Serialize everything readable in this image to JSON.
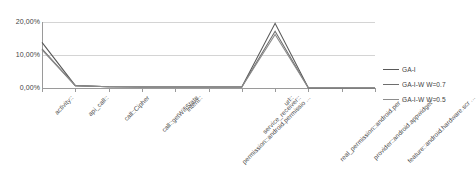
{
  "chart_data": {
    "type": "line",
    "title": "",
    "xlabel": "",
    "ylabel": "",
    "ylim": [
      0,
      25
    ],
    "ytick_values": [
      0,
      10,
      20
    ],
    "ytick_labels": [
      "0,00%",
      "10,00%",
      "20,00%"
    ],
    "grid": true,
    "legend_position": "right",
    "categories": [
      "activity::",
      "api_call::",
      "call::Cipher",
      "call::getWifiState",
      "intent::",
      "permission::android.permissio ...",
      "service_receiver::",
      "url::",
      "real_permission::android.per ...",
      "provider::android.appwidget ...",
      "feature::android.hardware.scr ..."
    ],
    "series": [
      {
        "name": "GA-I",
        "color": "#595959",
        "values": [
          17.3,
          0.9,
          0.5,
          0.4,
          0.4,
          0.4,
          0.4,
          24.5,
          0.0,
          0.0,
          0.0
        ]
      },
      {
        "name": "GA-I-W W=0.7",
        "color": "#6e6e6e",
        "values": [
          14.8,
          0.9,
          0.5,
          0.4,
          0.4,
          0.4,
          0.4,
          21.5,
          0.0,
          0.0,
          0.0
        ]
      },
      {
        "name": "GA-I-W W=0.5",
        "color": "#8c8c8c",
        "values": [
          14.4,
          0.9,
          0.5,
          0.4,
          0.4,
          0.4,
          0.4,
          20.3,
          0.0,
          0.0,
          0.0
        ]
      }
    ]
  },
  "legend": {
    "items": [
      {
        "label": "GA-I",
        "color": "#595959"
      },
      {
        "label": "GA-I-W W=0.7",
        "color": "#6e6e6e"
      },
      {
        "label": "GA-I-W W=0.5",
        "color": "#8c8c8c"
      }
    ]
  },
  "axes": {
    "y_labels": [
      "20,00%",
      "10,00%",
      "0,00%"
    ],
    "x_labels": [
      "activity::",
      "api_call::",
      "call::Cipher",
      "call::getWifiState",
      "intent::",
      "permission::android.permissio ...",
      "service_receiver::",
      "url::",
      "real_permission::android.per ...",
      "provider::android.appwidget ...",
      "feature::android.hardware.scr ..."
    ]
  },
  "colors": {
    "grid": "#d4d4d4",
    "axis": "#9a9a9a",
    "text": "#3f3f3f",
    "background": "#ffffff"
  }
}
